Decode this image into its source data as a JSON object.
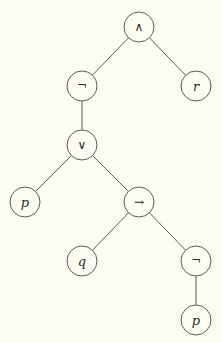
{
  "diagram": {
    "type": "syntax-tree",
    "formula": "(¬(p ∨ (q → ¬p))) ∧ r",
    "colors": {
      "background": "#fdfcf3",
      "stroke": "#5a5a5a",
      "text": "#2a2a2a"
    },
    "node_radius": 15,
    "nodes": [
      {
        "id": "n0",
        "label": "∧",
        "kind": "operator",
        "name": "and",
        "x": 139,
        "y": 27
      },
      {
        "id": "n1",
        "label": "¬",
        "kind": "operator",
        "name": "not",
        "x": 82,
        "y": 86
      },
      {
        "id": "n2",
        "label": "r",
        "kind": "variable",
        "name": "r",
        "x": 196,
        "y": 86
      },
      {
        "id": "n3",
        "label": "∨",
        "kind": "operator",
        "name": "or",
        "x": 82,
        "y": 145
      },
      {
        "id": "n4",
        "label": "p",
        "kind": "variable",
        "name": "p",
        "x": 25,
        "y": 202
      },
      {
        "id": "n5",
        "label": "→",
        "kind": "operator",
        "name": "implies",
        "x": 139,
        "y": 202
      },
      {
        "id": "n6",
        "label": "q",
        "kind": "variable",
        "name": "q",
        "x": 82,
        "y": 261
      },
      {
        "id": "n7",
        "label": "¬",
        "kind": "operator",
        "name": "not",
        "x": 196,
        "y": 261
      },
      {
        "id": "n8",
        "label": "p",
        "kind": "variable",
        "name": "p",
        "x": 196,
        "y": 320
      }
    ],
    "edges": [
      {
        "from": "n0",
        "to": "n1"
      },
      {
        "from": "n0",
        "to": "n2"
      },
      {
        "from": "n1",
        "to": "n3"
      },
      {
        "from": "n3",
        "to": "n4"
      },
      {
        "from": "n3",
        "to": "n5"
      },
      {
        "from": "n5",
        "to": "n6"
      },
      {
        "from": "n5",
        "to": "n7"
      },
      {
        "from": "n7",
        "to": "n8"
      }
    ]
  }
}
